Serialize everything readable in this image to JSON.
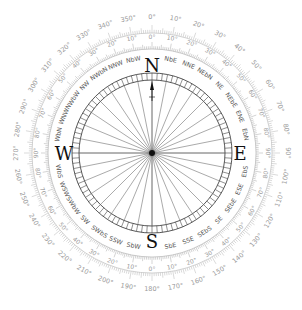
{
  "diagram": {
    "center": {
      "x": 152,
      "y": 153
    },
    "colors": {
      "background": "#ffffff",
      "outer_ring": "#b5b5b5",
      "inner_ring": "#a8a8a8",
      "card_ring": "#444444",
      "rays": "#555555",
      "cardinal": "#111111",
      "point_text": "#555555",
      "degree_text": "#9a9a9a"
    },
    "outer_scale": {
      "label_radius": 136,
      "tick_inner": 120,
      "tick_outer": 128,
      "labels": [
        "0°",
        "10°",
        "20°",
        "30°",
        "40°",
        "50°",
        "60°",
        "70°",
        "80°",
        "90°",
        "100°",
        "110°",
        "120°",
        "130°",
        "140°",
        "150°",
        "160°",
        "170°",
        "180°",
        "190°",
        "200°",
        "210°",
        "220°",
        "230°",
        "240°",
        "250°",
        "260°",
        "270°",
        "280°",
        "290°",
        "300°",
        "310°",
        "320°",
        "330°",
        "340°",
        "350°"
      ]
    },
    "inner_scale": {
      "label_radius": 116,
      "tick_inner": 104,
      "tick_outer": 111,
      "labels": [
        "0°",
        "10°",
        "20°",
        "30°",
        "40°",
        "50°",
        "60°",
        "70°",
        "80°",
        "90°",
        "80°",
        "70°",
        "60°",
        "50°",
        "40°",
        "30°",
        "20°",
        "10°",
        "0°",
        "10°",
        "20°",
        "30°",
        "40°",
        "50°",
        "60°",
        "70°",
        "80°",
        "90°",
        "80°",
        "70°",
        "60°",
        "50°",
        "40°",
        "30°",
        "20°",
        "10°"
      ]
    },
    "cardinals": [
      {
        "label": "N",
        "angle": 0
      },
      {
        "label": "E",
        "angle": 90
      },
      {
        "label": "S",
        "angle": 180
      },
      {
        "label": "W",
        "angle": 270
      }
    ],
    "points": [
      "N",
      "NbE",
      "NNE",
      "NEbN",
      "NE",
      "NEbE",
      "ENE",
      "EbN",
      "E",
      "EbS",
      "ESE",
      "SEbE",
      "SE",
      "SEbS",
      "SSE",
      "SbE",
      "S",
      "SbW",
      "SSW",
      "SWbS",
      "SW",
      "SWbW",
      "WSW",
      "WbS",
      "W",
      "WbN",
      "WNW",
      "NWbW",
      "NW",
      "NWbN",
      "NNW",
      "NbW"
    ],
    "points_radius": 95,
    "card_ring": {
      "outer_radius": 80,
      "inner_radius": 73,
      "segments": 96
    },
    "rays": 32,
    "north_pointer": "arrow"
  }
}
